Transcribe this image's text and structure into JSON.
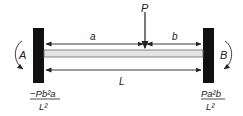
{
  "diagram": {
    "type": "fixed-fixed beam with point load",
    "load_label": "P",
    "dim_a": "a",
    "dim_b": "b",
    "dim_L": "L",
    "moment_left_label": "A",
    "moment_right_label": "B",
    "moment_left_formula": {
      "numerator": "−Pb²a",
      "denominator": "L²"
    },
    "moment_right_formula": {
      "numerator": "Pa²b",
      "denominator": "L²"
    },
    "colors": {
      "wall": "#111111",
      "beam_fill": "#e4e4e4",
      "beam_stroke": "#555555",
      "line": "#222222"
    }
  }
}
